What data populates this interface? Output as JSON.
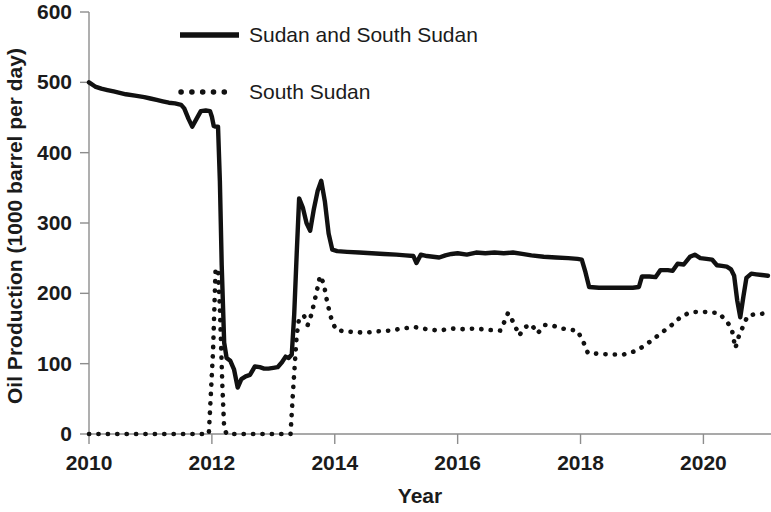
{
  "chart_data": {
    "type": "line",
    "title": "",
    "xlabel": "Year",
    "ylabel": "Oil Production (1000 barrel per day)",
    "xlim": [
      2010,
      2021.1
    ],
    "ylim": [
      0,
      600
    ],
    "xticks": [
      2010,
      2012,
      2014,
      2016,
      2018,
      2020
    ],
    "xticklabels": [
      "2010",
      "2012",
      "2014",
      "2016",
      "2018",
      "2020"
    ],
    "yticks": [
      0,
      100,
      200,
      300,
      400,
      500,
      600
    ],
    "yticklabels": [
      "0",
      "100",
      "200",
      "300",
      "400",
      "500",
      "600"
    ],
    "grid": false,
    "legend_position": "top-center",
    "series": [
      {
        "name": "Sudan and South Sudan",
        "style": "solid",
        "color": "#111111",
        "points": [
          [
            2010.0,
            500
          ],
          [
            2010.1,
            494
          ],
          [
            2010.2,
            491
          ],
          [
            2010.3,
            489
          ],
          [
            2010.4,
            487
          ],
          [
            2010.5,
            485
          ],
          [
            2010.6,
            483
          ],
          [
            2010.75,
            481
          ],
          [
            2010.9,
            479
          ],
          [
            2011.0,
            477
          ],
          [
            2011.1,
            475
          ],
          [
            2011.2,
            473
          ],
          [
            2011.3,
            471
          ],
          [
            2011.4,
            470
          ],
          [
            2011.5,
            468
          ],
          [
            2011.55,
            463
          ],
          [
            2011.62,
            448
          ],
          [
            2011.68,
            437
          ],
          [
            2011.75,
            448
          ],
          [
            2011.82,
            459
          ],
          [
            2011.9,
            460
          ],
          [
            2011.97,
            459
          ],
          [
            2012.0,
            451
          ],
          [
            2012.03,
            438
          ],
          [
            2012.06,
            437
          ],
          [
            2012.1,
            437
          ],
          [
            2012.13,
            360
          ],
          [
            2012.16,
            240
          ],
          [
            2012.2,
            130
          ],
          [
            2012.24,
            108
          ],
          [
            2012.3,
            104
          ],
          [
            2012.36,
            92
          ],
          [
            2012.42,
            66
          ],
          [
            2012.48,
            78
          ],
          [
            2012.55,
            82
          ],
          [
            2012.62,
            84
          ],
          [
            2012.7,
            96
          ],
          [
            2012.78,
            95
          ],
          [
            2012.85,
            93
          ],
          [
            2012.92,
            93
          ],
          [
            2013.0,
            94
          ],
          [
            2013.07,
            95
          ],
          [
            2013.14,
            102
          ],
          [
            2013.2,
            110
          ],
          [
            2013.25,
            108
          ],
          [
            2013.3,
            113
          ],
          [
            2013.34,
            170
          ],
          [
            2013.38,
            255
          ],
          [
            2013.42,
            335
          ],
          [
            2013.48,
            322
          ],
          [
            2013.54,
            300
          ],
          [
            2013.6,
            289
          ],
          [
            2013.66,
            320
          ],
          [
            2013.72,
            345
          ],
          [
            2013.78,
            360
          ],
          [
            2013.84,
            330
          ],
          [
            2013.9,
            285
          ],
          [
            2013.96,
            262
          ],
          [
            2014.04,
            260
          ],
          [
            2014.2,
            259
          ],
          [
            2014.4,
            258
          ],
          [
            2014.6,
            257
          ],
          [
            2014.8,
            256
          ],
          [
            2015.0,
            255
          ],
          [
            2015.15,
            254
          ],
          [
            2015.28,
            253
          ],
          [
            2015.33,
            243
          ],
          [
            2015.4,
            255
          ],
          [
            2015.5,
            253
          ],
          [
            2015.6,
            252
          ],
          [
            2015.7,
            251
          ],
          [
            2015.8,
            254
          ],
          [
            2015.9,
            256
          ],
          [
            2016.0,
            257
          ],
          [
            2016.15,
            255
          ],
          [
            2016.3,
            258
          ],
          [
            2016.45,
            257
          ],
          [
            2016.6,
            258
          ],
          [
            2016.75,
            257
          ],
          [
            2016.9,
            258
          ],
          [
            2017.05,
            256
          ],
          [
            2017.2,
            254
          ],
          [
            2017.4,
            252
          ],
          [
            2017.6,
            251
          ],
          [
            2017.8,
            250
          ],
          [
            2017.95,
            249
          ],
          [
            2018.02,
            248
          ],
          [
            2018.08,
            230
          ],
          [
            2018.14,
            209
          ],
          [
            2018.3,
            208
          ],
          [
            2018.5,
            208
          ],
          [
            2018.7,
            208
          ],
          [
            2018.85,
            208
          ],
          [
            2018.95,
            209
          ],
          [
            2019.0,
            224
          ],
          [
            2019.12,
            224
          ],
          [
            2019.22,
            223
          ],
          [
            2019.3,
            233
          ],
          [
            2019.42,
            233
          ],
          [
            2019.5,
            232
          ],
          [
            2019.58,
            242
          ],
          [
            2019.68,
            241
          ],
          [
            2019.78,
            252
          ],
          [
            2019.86,
            255
          ],
          [
            2019.95,
            250
          ],
          [
            2020.05,
            249
          ],
          [
            2020.14,
            248
          ],
          [
            2020.22,
            240
          ],
          [
            2020.3,
            239
          ],
          [
            2020.38,
            238
          ],
          [
            2020.45,
            234
          ],
          [
            2020.5,
            225
          ],
          [
            2020.55,
            190
          ],
          [
            2020.6,
            166
          ],
          [
            2020.65,
            195
          ],
          [
            2020.7,
            222
          ],
          [
            2020.78,
            228
          ],
          [
            2020.86,
            227
          ],
          [
            2020.95,
            226
          ],
          [
            2021.05,
            225
          ]
        ]
      },
      {
        "name": "South Sudan",
        "style": "dotted",
        "color": "#111111",
        "points": [
          [
            2010.0,
            0
          ],
          [
            2010.2,
            0
          ],
          [
            2010.4,
            0
          ],
          [
            2010.6,
            0
          ],
          [
            2010.8,
            0
          ],
          [
            2011.0,
            0
          ],
          [
            2011.2,
            0
          ],
          [
            2011.4,
            0
          ],
          [
            2011.6,
            0
          ],
          [
            2011.8,
            0
          ],
          [
            2011.95,
            0
          ],
          [
            2012.02,
            120
          ],
          [
            2012.06,
            235
          ],
          [
            2012.1,
            234
          ],
          [
            2012.13,
            180
          ],
          [
            2012.17,
            70
          ],
          [
            2012.2,
            8
          ],
          [
            2012.24,
            0
          ],
          [
            2012.4,
            0
          ],
          [
            2012.6,
            0
          ],
          [
            2012.8,
            0
          ],
          [
            2013.0,
            0
          ],
          [
            2013.15,
            0
          ],
          [
            2013.28,
            0
          ],
          [
            2013.32,
            60
          ],
          [
            2013.38,
            140
          ],
          [
            2013.42,
            165
          ],
          [
            2013.5,
            168
          ],
          [
            2013.56,
            155
          ],
          [
            2013.62,
            170
          ],
          [
            2013.7,
            200
          ],
          [
            2013.76,
            225
          ],
          [
            2013.82,
            214
          ],
          [
            2013.88,
            186
          ],
          [
            2013.95,
            162
          ],
          [
            2014.02,
            148
          ],
          [
            2014.15,
            146
          ],
          [
            2014.3,
            145
          ],
          [
            2014.5,
            144
          ],
          [
            2014.7,
            146
          ],
          [
            2014.9,
            147
          ],
          [
            2015.1,
            150
          ],
          [
            2015.3,
            152
          ],
          [
            2015.5,
            149
          ],
          [
            2015.7,
            147
          ],
          [
            2015.9,
            150
          ],
          [
            2016.1,
            149
          ],
          [
            2016.3,
            150
          ],
          [
            2016.5,
            148
          ],
          [
            2016.7,
            147
          ],
          [
            2016.82,
            172
          ],
          [
            2016.92,
            157
          ],
          [
            2017.0,
            140
          ],
          [
            2017.1,
            152
          ],
          [
            2017.2,
            156
          ],
          [
            2017.3,
            143
          ],
          [
            2017.42,
            155
          ],
          [
            2017.55,
            154
          ],
          [
            2017.7,
            150
          ],
          [
            2017.85,
            148
          ],
          [
            2017.95,
            147
          ],
          [
            2018.05,
            130
          ],
          [
            2018.12,
            115
          ],
          [
            2018.3,
            114
          ],
          [
            2018.5,
            113
          ],
          [
            2018.7,
            113
          ],
          [
            2018.9,
            118
          ],
          [
            2019.05,
            126
          ],
          [
            2019.2,
            136
          ],
          [
            2019.35,
            146
          ],
          [
            2019.5,
            156
          ],
          [
            2019.65,
            168
          ],
          [
            2019.8,
            173
          ],
          [
            2019.95,
            174
          ],
          [
            2020.1,
            173
          ],
          [
            2020.25,
            172
          ],
          [
            2020.38,
            160
          ],
          [
            2020.46,
            150
          ],
          [
            2020.52,
            122
          ],
          [
            2020.58,
            140
          ],
          [
            2020.64,
            152
          ],
          [
            2020.72,
            168
          ],
          [
            2020.82,
            170
          ],
          [
            2020.95,
            171
          ],
          [
            2021.05,
            172
          ]
        ]
      }
    ]
  },
  "legend": {
    "entries": [
      {
        "label": "Sudan and South Sudan",
        "style": "solid"
      },
      {
        "label": "South Sudan",
        "style": "dotted"
      }
    ]
  },
  "axis": {
    "y_title": "Oil Production (1000 barrel per day)",
    "x_title": "Year"
  }
}
